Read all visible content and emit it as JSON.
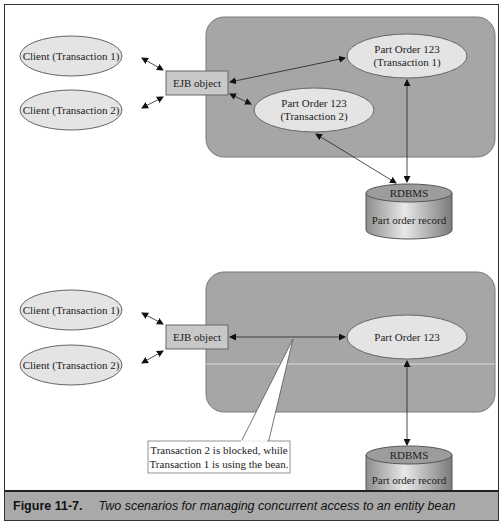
{
  "diagram_top": {
    "clients": [
      {
        "label": "Client (Transaction 1)"
      },
      {
        "label": "Client (Transaction 2)"
      }
    ],
    "ejb_object": {
      "label": "EJB object"
    },
    "instances": [
      {
        "line1": "Part Order 123",
        "line2": "(Transaction 1)"
      },
      {
        "line1": "Part Order 123",
        "line2": "(Transaction 2)"
      }
    ],
    "database": {
      "title": "RDBMS",
      "subtitle": "Part order record"
    }
  },
  "diagram_bottom": {
    "clients": [
      {
        "label": "Client (Transaction 1)"
      },
      {
        "label": "Client (Transaction 2)"
      }
    ],
    "ejb_object": {
      "label": "EJB object"
    },
    "instance": {
      "label": "Part Order 123"
    },
    "callout": {
      "line1": "Transaction 2 is blocked, while",
      "line2": "Transaction 1 is using the bean."
    },
    "database": {
      "title": "RDBMS",
      "subtitle": "Part order record"
    }
  },
  "caption": {
    "figure_number": "Figure 11-7.",
    "text": "Two scenarios for managing concurrent access to an entity bean"
  },
  "colors": {
    "container": "#a6a6a6",
    "ellipse": "#e4e4e4",
    "box": "#c8c8c8",
    "caption_bg": "#a9a9a9"
  }
}
